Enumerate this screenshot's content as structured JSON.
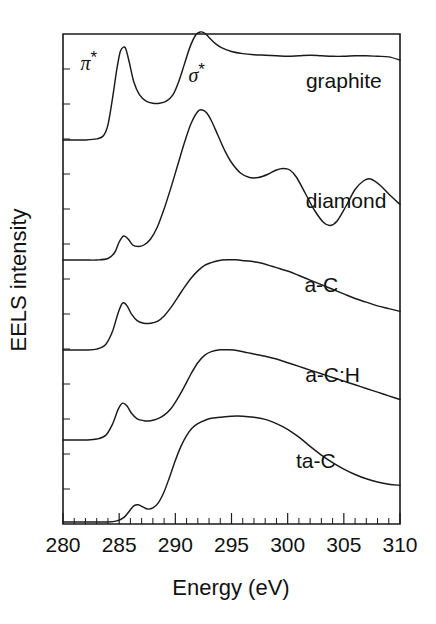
{
  "chart_data": {
    "type": "line",
    "title": "",
    "xlabel": "Energy (eV)",
    "ylabel": "EELS intensity",
    "xlim": [
      280,
      310
    ],
    "ylim": [
      0,
      1
    ],
    "grid": false,
    "legend_position": "inline-right",
    "xticks": [
      280,
      285,
      290,
      295,
      300,
      305,
      310
    ],
    "xtick_labels": [
      "280",
      "285",
      "290",
      "295",
      "300",
      "305",
      "310"
    ],
    "xtick_minor_step": 1,
    "yticks_labeled": false,
    "annotations": [
      {
        "text": "π",
        "superscript": "*",
        "x": 282.3,
        "y_px": 70,
        "name": "pi-star-annotation"
      },
      {
        "text": "σ",
        "superscript": "*",
        "x": 291.9,
        "y_px": 82,
        "name": "sigma-star-annotation"
      }
    ],
    "series": [
      {
        "name": "graphite",
        "label": "graphite",
        "label_x": 305.0,
        "label_y_px": 88,
        "color": "#1a1a1a",
        "offset_px": 140,
        "x": [
          280.0,
          281.0,
          282.0,
          283.0,
          283.6,
          284.0,
          284.4,
          284.8,
          285.1,
          285.4,
          285.6,
          285.9,
          286.3,
          286.8,
          287.4,
          288.0,
          288.6,
          289.2,
          289.8,
          290.3,
          290.8,
          291.3,
          291.8,
          292.2,
          292.6,
          293.0,
          293.6,
          294.2,
          295.0,
          296.0,
          297.0,
          298.0,
          299.0,
          300.0,
          301.0,
          302.0,
          303.0,
          304.0,
          305.0,
          306.0,
          307.0,
          308.0,
          309.0,
          310.0
        ],
        "y": [
          0.0,
          0.0,
          0.0,
          0.01,
          0.04,
          0.14,
          0.38,
          0.66,
          0.82,
          0.86,
          0.84,
          0.72,
          0.54,
          0.42,
          0.36,
          0.34,
          0.34,
          0.36,
          0.42,
          0.54,
          0.7,
          0.86,
          0.97,
          1.0,
          0.99,
          0.95,
          0.89,
          0.85,
          0.82,
          0.8,
          0.79,
          0.785,
          0.78,
          0.775,
          0.78,
          0.785,
          0.78,
          0.775,
          0.775,
          0.78,
          0.78,
          0.775,
          0.77,
          0.74
        ]
      },
      {
        "name": "diamond",
        "label": "diamond",
        "label_x": 305.2,
        "label_y_px": 208,
        "color": "#1a1a1a",
        "offset_px": 260,
        "x": [
          280.0,
          281.0,
          282.0,
          283.0,
          284.0,
          284.6,
          285.0,
          285.4,
          285.8,
          286.2,
          286.7,
          287.2,
          287.8,
          288.4,
          289.0,
          289.6,
          290.2,
          290.8,
          291.4,
          292.0,
          292.4,
          292.8,
          293.2,
          293.8,
          294.4,
          295.0,
          295.8,
          296.6,
          297.4,
          298.2,
          299.0,
          299.6,
          300.2,
          300.8,
          301.6,
          302.4,
          303.2,
          303.8,
          304.4,
          305.2,
          306.0,
          306.8,
          307.4,
          308.2,
          309.0,
          310.0
        ],
        "y": [
          0.0,
          0.0,
          0.0,
          0.0,
          0.01,
          0.05,
          0.12,
          0.16,
          0.14,
          0.1,
          0.09,
          0.1,
          0.14,
          0.22,
          0.34,
          0.48,
          0.63,
          0.78,
          0.91,
          0.99,
          1.0,
          0.98,
          0.93,
          0.83,
          0.73,
          0.65,
          0.58,
          0.55,
          0.55,
          0.57,
          0.6,
          0.61,
          0.6,
          0.55,
          0.44,
          0.33,
          0.25,
          0.23,
          0.26,
          0.36,
          0.47,
          0.53,
          0.54,
          0.5,
          0.44,
          0.37
        ]
      },
      {
        "name": "a-C",
        "label": "a-C",
        "label_x": 303.0,
        "label_y_px": 292,
        "color": "#1a1a1a",
        "offset_px": 350,
        "x": [
          280.0,
          281.0,
          282.0,
          283.0,
          283.8,
          284.4,
          284.9,
          285.3,
          285.7,
          286.1,
          286.6,
          287.2,
          287.8,
          288.4,
          289.0,
          289.6,
          290.2,
          290.8,
          291.4,
          292.0,
          292.6,
          293.2,
          293.8,
          294.6,
          295.4,
          296.2,
          297.0,
          297.8,
          298.6,
          299.4,
          300.2,
          301.0,
          302.0,
          303.0,
          304.0,
          305.0,
          306.0,
          307.0,
          308.0,
          309.0,
          310.0
        ],
        "y": [
          0.0,
          0.0,
          0.0,
          0.01,
          0.06,
          0.2,
          0.4,
          0.51,
          0.48,
          0.39,
          0.32,
          0.29,
          0.29,
          0.31,
          0.37,
          0.46,
          0.57,
          0.68,
          0.78,
          0.86,
          0.92,
          0.95,
          0.97,
          0.98,
          0.98,
          0.97,
          0.96,
          0.94,
          0.91,
          0.88,
          0.85,
          0.81,
          0.76,
          0.71,
          0.66,
          0.61,
          0.56,
          0.52,
          0.48,
          0.45,
          0.42
        ]
      },
      {
        "name": "a-C:H",
        "label": "a-C:H",
        "label_x": 304.0,
        "label_y_px": 382,
        "color": "#1a1a1a",
        "offset_px": 440,
        "x": [
          280.0,
          281.0,
          282.0,
          283.0,
          283.8,
          284.4,
          284.9,
          285.3,
          285.7,
          286.1,
          286.6,
          287.2,
          287.8,
          288.4,
          289.0,
          289.6,
          290.2,
          290.8,
          291.4,
          292.0,
          292.6,
          293.2,
          294.0,
          294.8,
          295.6,
          296.4,
          297.2,
          298.0,
          299.0,
          300.0,
          301.0,
          302.0,
          303.0,
          304.0,
          305.0,
          306.0,
          307.0,
          308.0,
          309.0,
          310.0
        ],
        "y": [
          0.0,
          0.0,
          0.0,
          0.01,
          0.05,
          0.17,
          0.33,
          0.4,
          0.37,
          0.29,
          0.23,
          0.21,
          0.21,
          0.23,
          0.27,
          0.34,
          0.45,
          0.58,
          0.72,
          0.84,
          0.92,
          0.96,
          0.98,
          0.98,
          0.97,
          0.95,
          0.93,
          0.91,
          0.88,
          0.84,
          0.8,
          0.76,
          0.72,
          0.68,
          0.64,
          0.6,
          0.56,
          0.52,
          0.48,
          0.44
        ]
      },
      {
        "name": "ta-C",
        "label": "ta-C",
        "label_x": 302.5,
        "label_y_px": 468,
        "color": "#1a1a1a",
        "offset_px": 522,
        "x": [
          280.0,
          281.0,
          282.0,
          283.0,
          284.0,
          284.8,
          285.4,
          285.9,
          286.3,
          286.7,
          287.1,
          287.5,
          288.0,
          288.5,
          289.0,
          289.5,
          290.0,
          290.5,
          291.0,
          291.5,
          292.0,
          292.6,
          293.2,
          294.0,
          295.0,
          296.0,
          297.0,
          298.0,
          298.8,
          299.6,
          300.4,
          301.2,
          302.0,
          303.0,
          304.0,
          305.0,
          306.0,
          307.0,
          308.0,
          309.0,
          310.0
        ],
        "y": [
          0.0,
          0.0,
          0.0,
          0.0,
          0.0,
          0.01,
          0.04,
          0.1,
          0.15,
          0.16,
          0.14,
          0.12,
          0.13,
          0.18,
          0.28,
          0.42,
          0.57,
          0.7,
          0.8,
          0.87,
          0.91,
          0.94,
          0.96,
          0.97,
          0.98,
          0.98,
          0.97,
          0.95,
          0.92,
          0.88,
          0.83,
          0.77,
          0.7,
          0.62,
          0.55,
          0.49,
          0.44,
          0.4,
          0.37,
          0.35,
          0.34
        ]
      }
    ]
  }
}
